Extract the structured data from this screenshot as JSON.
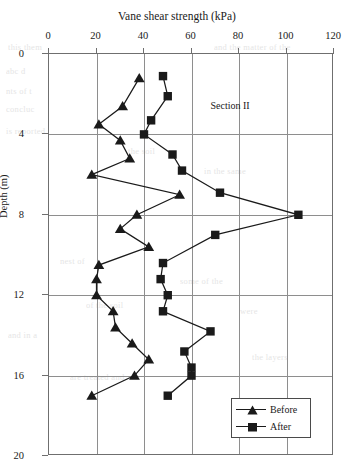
{
  "chart_data": {
    "type": "line",
    "title": "Vane shear strength (kPa)",
    "xlabel": "Vane shear strength (kPa)",
    "ylabel": "Depth (m)",
    "xlim": [
      0,
      120
    ],
    "ylim": [
      0,
      20
    ],
    "y_inverted": true,
    "grid": true,
    "legend_position": "bottom-right",
    "annotation": "Section II",
    "xticks": [
      0,
      20,
      40,
      60,
      80,
      100,
      120
    ],
    "yticks": [
      0,
      4,
      8,
      12,
      16,
      20
    ],
    "series": [
      {
        "name": "Before",
        "marker": "triangle",
        "points": [
          {
            "strength": 38,
            "depth": 1.2
          },
          {
            "strength": 31,
            "depth": 2.6
          },
          {
            "strength": 21,
            "depth": 3.5
          },
          {
            "strength": 30,
            "depth": 4.3
          },
          {
            "strength": 34,
            "depth": 5.2
          },
          {
            "strength": 18,
            "depth": 6.0
          },
          {
            "strength": 55,
            "depth": 7.0
          },
          {
            "strength": 37,
            "depth": 8.0
          },
          {
            "strength": 30,
            "depth": 8.7
          },
          {
            "strength": 42,
            "depth": 9.6
          },
          {
            "strength": 21,
            "depth": 10.5
          },
          {
            "strength": 20,
            "depth": 11.2
          },
          {
            "strength": 20,
            "depth": 12.0
          },
          {
            "strength": 27,
            "depth": 12.8
          },
          {
            "strength": 28,
            "depth": 13.6
          },
          {
            "strength": 35,
            "depth": 14.4
          },
          {
            "strength": 42,
            "depth": 15.2
          },
          {
            "strength": 36,
            "depth": 16.0
          },
          {
            "strength": 18,
            "depth": 17.0
          }
        ]
      },
      {
        "name": "After",
        "marker": "square",
        "points": [
          {
            "strength": 48,
            "depth": 1.1
          },
          {
            "strength": 50,
            "depth": 2.1
          },
          {
            "strength": 43,
            "depth": 3.3
          },
          {
            "strength": 40,
            "depth": 4.0
          },
          {
            "strength": 52,
            "depth": 5.0
          },
          {
            "strength": 56,
            "depth": 5.8
          },
          {
            "strength": 72,
            "depth": 6.9
          },
          {
            "strength": 105,
            "depth": 8.0
          },
          {
            "strength": 70,
            "depth": 9.0
          },
          {
            "strength": 48,
            "depth": 10.4
          },
          {
            "strength": 47,
            "depth": 11.2
          },
          {
            "strength": 50,
            "depth": 12.0
          },
          {
            "strength": 48,
            "depth": 12.8
          },
          {
            "strength": 68,
            "depth": 13.8
          },
          {
            "strength": 57,
            "depth": 14.8
          },
          {
            "strength": 60,
            "depth": 15.6
          },
          {
            "strength": 60,
            "depth": 16.0
          },
          {
            "strength": 50,
            "depth": 17.0
          }
        ]
      }
    ]
  },
  "legend": {
    "entries": [
      {
        "label": "Before"
      },
      {
        "label": "After"
      }
    ]
  },
  "bleed_text": [
    {
      "t": "this      them",
      "x": 8,
      "y": 42
    },
    {
      "t": "and the matter of the",
      "x": 214,
      "y": 42
    },
    {
      "t": "abc  d",
      "x": 6,
      "y": 66
    },
    {
      "t": "nts   of  t",
      "x": 6,
      "y": 86
    },
    {
      "t": "concluc",
      "x": 6,
      "y": 104
    },
    {
      "t": "is reported",
      "x": 6,
      "y": 126
    },
    {
      "t": "the soil",
      "x": 128,
      "y": 146
    },
    {
      "t": "in the same",
      "x": 204,
      "y": 166
    },
    {
      "t": "nest of",
      "x": 60,
      "y": 256
    },
    {
      "t": "some of the",
      "x": 180,
      "y": 276
    },
    {
      "t": "of the soil",
      "x": 86,
      "y": 300
    },
    {
      "t": "were",
      "x": 240,
      "y": 306
    },
    {
      "t": "and in a",
      "x": 8,
      "y": 330
    },
    {
      "t": "the layers",
      "x": 252,
      "y": 352
    },
    {
      "t": "are treated and",
      "x": 70,
      "y": 372
    }
  ]
}
